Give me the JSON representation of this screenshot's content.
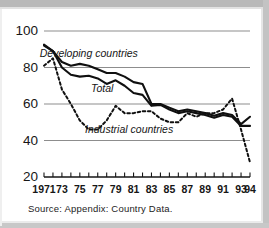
{
  "source_note": "Source:  Appendix:  Country Data.",
  "axis": {
    "y_ticks": [
      "100",
      "80",
      "60",
      "40",
      "20"
    ],
    "x_ticks": [
      "1971",
      "73",
      "75",
      "77",
      "79",
      "81",
      "83",
      "85",
      "87",
      "89",
      "91",
      "93",
      "94"
    ]
  },
  "annotations": {
    "developing": "Developing countries",
    "total": "Total",
    "industrial": "Industrial countries"
  },
  "colors": {
    "line": "#101010",
    "grid": "#8d8d8d",
    "text": "#161616",
    "frame": "#b9b9b9"
  },
  "chart_data": {
    "type": "line",
    "title": "",
    "subtitle": "",
    "xlabel": "",
    "ylabel": "",
    "xlim": [
      1971,
      1994
    ],
    "ylim": [
      20,
      100
    ],
    "y_ticks": [
      20,
      40,
      60,
      80,
      100
    ],
    "x_tick_years": [
      1971,
      1973,
      1975,
      1977,
      1979,
      1981,
      1983,
      1985,
      1987,
      1989,
      1991,
      1993,
      1994
    ],
    "grid": "horizontal",
    "legend": "inline-annotations",
    "x": [
      1971,
      1972,
      1973,
      1974,
      1975,
      1976,
      1977,
      1978,
      1979,
      1980,
      1981,
      1982,
      1983,
      1984,
      1985,
      1986,
      1987,
      1988,
      1989,
      1990,
      1991,
      1992,
      1993,
      1994
    ],
    "series": [
      {
        "name": "Developing countries",
        "style": "solid",
        "values": [
          92.5,
          89.0,
          83.0,
          81.0,
          82.0,
          81.0,
          79.0,
          77.0,
          77.0,
          75.0,
          72.0,
          71.0,
          60.0,
          60.0,
          58.0,
          56.0,
          57.0,
          56.0,
          55.0,
          53.5,
          55.0,
          54.0,
          49.0,
          53.0
        ]
      },
      {
        "name": "Total",
        "style": "solid",
        "values": [
          92.0,
          89.0,
          80.0,
          76.0,
          75.0,
          75.5,
          74.0,
          71.0,
          73.0,
          70.0,
          66.0,
          65.0,
          59.0,
          59.5,
          57.0,
          55.0,
          56.0,
          55.0,
          54.0,
          52.5,
          54.0,
          53.0,
          48.0,
          48.0
        ]
      },
      {
        "name": "Industrial countries",
        "style": "dashed",
        "values": [
          81.0,
          85.0,
          68.0,
          60.0,
          51.0,
          46.0,
          46.0,
          51.0,
          59.0,
          55.0,
          55.0,
          56.0,
          56.0,
          52.0,
          50.0,
          50.0,
          55.0,
          53.0,
          55.0,
          55.0,
          57.0,
          63.0,
          46.0,
          28.0
        ]
      }
    ],
    "annotations": [
      {
        "text": "Developing countries",
        "x": 1976.0,
        "y": 86.0
      },
      {
        "text": "Total",
        "x": 1977.5,
        "y": 66.5
      },
      {
        "text": "Industrial countries",
        "x": 1980.5,
        "y": 44.0
      }
    ]
  }
}
